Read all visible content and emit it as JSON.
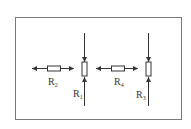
{
  "diagram": {
    "type": "circuit-resistor-arrangement",
    "frame_color": "#7a7a7a",
    "line_color": "#333333",
    "background": "#ffffff",
    "groups": [
      {
        "horizontal_resistor": {
          "label": "R",
          "subscript": "2"
        },
        "vertical_resistor": {
          "label": "R",
          "subscript": "1"
        }
      },
      {
        "horizontal_resistor": {
          "label": "R",
          "subscript": "4"
        },
        "vertical_resistor": {
          "label": "R",
          "subscript": "3"
        }
      }
    ]
  }
}
